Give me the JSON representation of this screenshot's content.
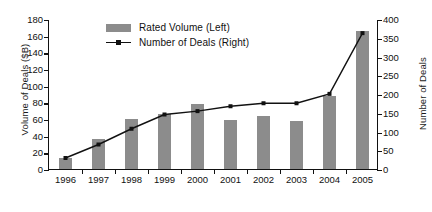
{
  "chart_data": {
    "type": "bar",
    "title": "",
    "subtitle": "",
    "xlabel": "",
    "ylabel": "Volume of Deals ($B)",
    "y2label": "Number of Deals",
    "categories": [
      "1996",
      "1997",
      "1998",
      "1999",
      "2000",
      "2001",
      "2002",
      "2003",
      "2004",
      "2005"
    ],
    "grid": false,
    "legend_position": "top-center",
    "ylim": [
      0,
      180
    ],
    "y2lim": [
      0,
      400
    ],
    "yticks": [
      0,
      20,
      40,
      60,
      80,
      100,
      120,
      140,
      160,
      180
    ],
    "y2ticks": [
      0,
      50,
      100,
      150,
      200,
      250,
      300,
      350,
      400
    ],
    "series": [
      {
        "name": "Rated Volume (Left)",
        "kind": "bar",
        "axis": "left",
        "color": "#8c8c8c",
        "unit": "$B",
        "values": [
          13,
          36,
          60,
          66,
          78,
          59,
          64,
          58,
          88,
          166
        ]
      },
      {
        "name": "Number of Deals (Right)",
        "kind": "line",
        "axis": "right",
        "color": "#111111",
        "unit": "deals",
        "values": [
          32,
          68,
          110,
          148,
          157,
          170,
          178,
          178,
          203,
          365
        ]
      }
    ]
  },
  "legend": {
    "items": [
      {
        "label": "Rated Volume (Left)",
        "marker": "bar-swatch"
      },
      {
        "label": "Number of Deals (Right)",
        "marker": "line-marker"
      }
    ]
  },
  "axes": {
    "left_title": "Volume of Deals ($B)",
    "right_title": "Number of Deals",
    "left_ticks": [
      "0",
      "20",
      "40",
      "60",
      "80",
      "100",
      "120",
      "140",
      "160",
      "180"
    ],
    "right_ticks": [
      "0",
      "50",
      "100",
      "150",
      "200",
      "250",
      "300",
      "350",
      "400"
    ],
    "x_ticks": [
      "1996",
      "1997",
      "1998",
      "1999",
      "2000",
      "2001",
      "2002",
      "2003",
      "2004",
      "2005"
    ]
  }
}
